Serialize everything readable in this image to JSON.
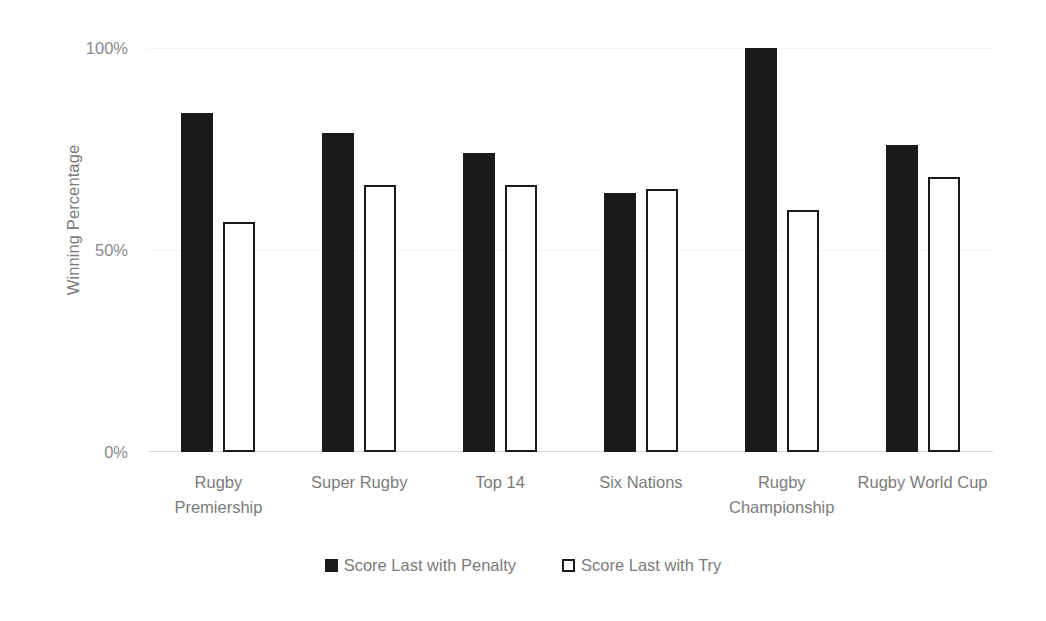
{
  "chart_data": {
    "type": "bar",
    "title": "",
    "xlabel": "",
    "ylabel": "Winning Percentage",
    "ylim": [
      0,
      100
    ],
    "yticks": [
      "0%",
      "50%",
      "100%"
    ],
    "ytick_values": [
      0,
      50,
      100
    ],
    "grid": true,
    "legend_position": "bottom",
    "categories": [
      "Rugby Premiership",
      "Super Rugby",
      "Top 14",
      "Six Nations",
      "Rugby Championship",
      "Rugby World Cup"
    ],
    "series": [
      {
        "name": "Score Last with Penalty",
        "color": "#1a1a1a",
        "style": "filled",
        "values": [
          84,
          79,
          74,
          64,
          100,
          76
        ]
      },
      {
        "name": "Score Last with Try",
        "color": "#ffffff",
        "style": "outlined",
        "values": [
          57,
          66,
          66,
          65,
          60,
          68
        ]
      }
    ]
  },
  "axis": {
    "y_title": "Winning Percentage",
    "y_ticks": [
      "100%",
      "50%",
      "0%"
    ]
  },
  "legend": {
    "items": [
      {
        "label": "Score Last with Penalty",
        "swatch": "filled-square-icon"
      },
      {
        "label": "Score Last with Try",
        "swatch": "outlined-square-icon"
      }
    ]
  },
  "colors": {
    "series_penalty": "#1a1a1a",
    "series_try": "#ffffff",
    "text": "#7b7b7b",
    "gridline": "#f4f4f4",
    "baseline": "#d9d9d9",
    "background": "#ffffff"
  }
}
